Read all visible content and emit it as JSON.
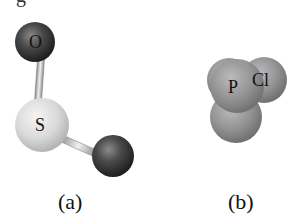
{
  "figure": {
    "top_partial_text": "g",
    "panels": [
      {
        "id": "a",
        "caption": "(a)",
        "style": "ball-and-stick",
        "atoms": [
          {
            "label": "O",
            "color": "#4a4a4a",
            "position": "top"
          },
          {
            "label": "S",
            "color": "#dcdcdc",
            "position": "center"
          },
          {
            "label": "",
            "color": "#3a3a3a",
            "position": "bottom-right"
          }
        ],
        "bonds": 2
      },
      {
        "id": "b",
        "caption": "(b)",
        "style": "space-filling",
        "atoms": [
          {
            "label": "P",
            "color": "#9a9a9a",
            "position": "center"
          },
          {
            "label": "Cl",
            "color": "#8c8c8c",
            "position": "right"
          },
          {
            "label": "",
            "color": "#8e8e8e",
            "position": "left-back"
          },
          {
            "label": "",
            "color": "#8a8a8a",
            "position": "bottom"
          }
        ]
      }
    ]
  }
}
